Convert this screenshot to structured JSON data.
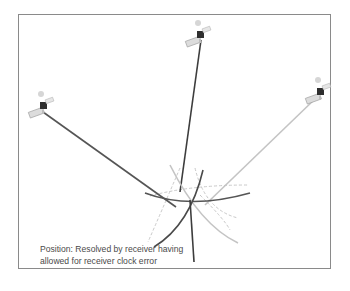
{
  "diagram": {
    "caption": {
      "line1": "Position: Resolved by receiver having",
      "line2": "allowed for receiver clock error"
    },
    "satellites": [
      {
        "id": "left",
        "x": 43,
        "y": 106,
        "range_line_color": "#555555"
      },
      {
        "id": "top",
        "x": 200,
        "y": 35,
        "range_line_color": "#3d3d3d"
      },
      {
        "id": "right",
        "x": 320,
        "y": 92,
        "range_line_color": "#c4c4c4"
      }
    ],
    "position_point": {
      "x": 190,
      "y": 201
    },
    "colors": {
      "frame": "#8a8a8a",
      "caption_text": "#4a4a4a",
      "arc_dark": "#555555",
      "arc_mid": "#4a4a4a",
      "arc_light": "#c4c4c4",
      "dashed_arc": "#c8c8c8"
    }
  }
}
